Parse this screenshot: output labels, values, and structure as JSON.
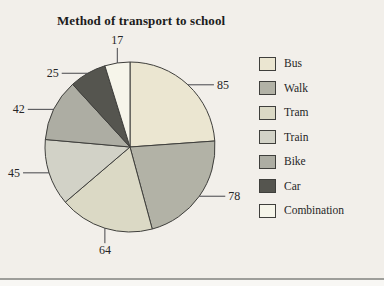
{
  "page": {
    "background": "#f2efea",
    "bottom_rule_color": "#9e9e9a"
  },
  "chart_data": {
    "type": "pie",
    "title": "Method of transport to school",
    "categories": [
      "Bus",
      "Walk",
      "Tram",
      "Train",
      "Bike",
      "Car",
      "Combination"
    ],
    "values": [
      85,
      78,
      64,
      45,
      42,
      25,
      17
    ],
    "slice_colors": [
      "#ebe6d1",
      "#b2b2a6",
      "#dbd9c5",
      "#d2d2c7",
      "#adada3",
      "#55554f",
      "#f6f5ea"
    ],
    "outline_color": "#3f3f3c",
    "label_color": "#262626",
    "direction": "clockwise",
    "start_angle_deg": 0,
    "legend_position": "right",
    "legend_entries": [
      "Bus",
      "Walk",
      "Tram",
      "Train",
      "Bike",
      "Car",
      "Combination"
    ],
    "value_labels_shown": true
  }
}
